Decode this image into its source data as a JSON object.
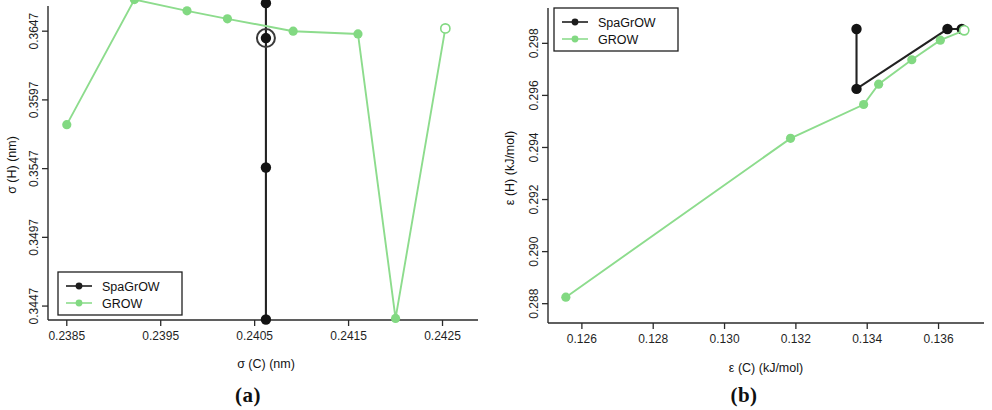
{
  "figure": {
    "panels": [
      {
        "caption": "(a)",
        "xlabel": "σ (C) (nm)",
        "ylabel": "σ (H) (nm)",
        "xticks": [
          "0.2385",
          "0.2395",
          "0.2405",
          "0.2415",
          "0.2425"
        ],
        "yticks": [
          "0.3647",
          "0.3597",
          "0.3547",
          "0.3497",
          "0.3447"
        ],
        "legend": [
          {
            "label": "SpaGrOW",
            "color": "#1d1d1d"
          },
          {
            "label": "GROW",
            "color": "#82d982"
          }
        ]
      },
      {
        "caption": "(b)",
        "xlabel": "ε (C) (kJ/mol)",
        "ylabel": "ε (H) (kJ/mol)",
        "xticks": [
          "0.126",
          "0.128",
          "0.130",
          "0.132",
          "0.134",
          "0.136"
        ],
        "yticks": [
          "0.298",
          "0.296",
          "0.294",
          "0.292",
          "0.290",
          "0.288"
        ],
        "legend": [
          {
            "label": "SpaGrOW",
            "color": "#1d1d1d"
          },
          {
            "label": "GROW",
            "color": "#82d982"
          }
        ]
      }
    ]
  },
  "chart_data": [
    {
      "type": "line",
      "title": "",
      "panel": "(a)",
      "xlabel": "σ (C) (nm)",
      "ylabel": "σ (H) (nm)",
      "xlim": [
        0.2383,
        0.24275
      ],
      "ylim": [
        0.34405,
        0.36595
      ],
      "xticks": [
        0.2385,
        0.2395,
        0.2405,
        0.2415,
        0.2425
      ],
      "yticks": [
        0.3447,
        0.3497,
        0.3547,
        0.3597,
        0.3647
      ],
      "grid": false,
      "legend_position": "bottom-left",
      "series": [
        {
          "name": "SpaGrOW",
          "color": "#1d1d1d",
          "marker": "filled-circle",
          "x": [
            0.24062,
            0.24062,
            0.24062,
            0.24062
          ],
          "y": [
            0.36674,
            0.3642,
            0.35478,
            0.34372
          ],
          "highlight_index": 1
        },
        {
          "name": "GROW",
          "color": "#82d982",
          "marker": "filled-circle",
          "x": [
            0.2385,
            0.23922,
            0.23978,
            0.24021,
            0.24091,
            0.2416,
            0.242,
            0.24253
          ],
          "y": [
            0.3579,
            0.367,
            0.36618,
            0.3656,
            0.3647,
            0.3645,
            0.3438,
            0.3649
          ],
          "open_marker_indices": [
            7
          ]
        }
      ]
    },
    {
      "type": "line",
      "title": "",
      "panel": "(b)",
      "xlabel": "ε (C) (kJ/mol)",
      "ylabel": "ε (H) (kJ/mol)",
      "xlim": [
        0.12505,
        0.13705
      ],
      "ylim": [
        0.28745,
        0.29905
      ],
      "xticks": [
        0.126,
        0.128,
        0.13,
        0.132,
        0.134,
        0.136
      ],
      "yticks": [
        0.288,
        0.29,
        0.292,
        0.294,
        0.296,
        0.298
      ],
      "grid": false,
      "legend_position": "top-left",
      "series": [
        {
          "name": "SpaGrOW",
          "color": "#1d1d1d",
          "marker": "filled-circle",
          "x": [
            0.1337,
            0.1337,
            0.13625,
            0.13665
          ],
          "y": [
            0.29855,
            0.29625,
            0.29855,
            0.29855
          ]
        },
        {
          "name": "GROW",
          "color": "#82d982",
          "marker": "filled-circle",
          "x": [
            0.12555,
            0.13185,
            0.1339,
            0.13432,
            0.13525,
            0.13605,
            0.13672
          ],
          "y": [
            0.28825,
            0.29435,
            0.29565,
            0.29643,
            0.29737,
            0.29812,
            0.2985
          ],
          "open_marker_indices": [
            6
          ]
        }
      ]
    }
  ]
}
